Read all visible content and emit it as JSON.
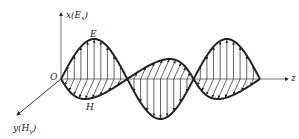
{
  "axes": {
    "x_label": "x(E",
    "x_sub": "x",
    "y_label": "y(H",
    "y_sub": "y",
    "z_label": "z",
    "origin_label": "O"
  },
  "waves": {
    "electric_label": "E",
    "magnetic_label": "H"
  },
  "colors": {
    "line": "#222222"
  }
}
